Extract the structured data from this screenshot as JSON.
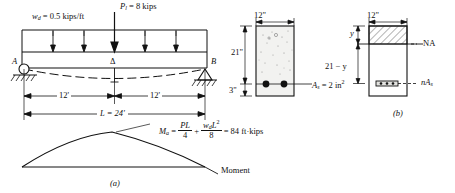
{
  "figure": {
    "title_a": "(a)",
    "title_b": "(b)"
  },
  "beam": {
    "distributed_load_label": "w",
    "distributed_load_sub": "d",
    "distributed_load_value": " = 0.5 kips/ft",
    "point_load_label": "P",
    "point_load_sub": "l",
    "point_load_value": " = 8 kips",
    "support_left": "A",
    "support_right": "B",
    "deflection_symbol": "Δ",
    "dim_left": "12'",
    "dim_right": "12'",
    "span_label": "L = 24'"
  },
  "moment_equation": {
    "symbol": "M",
    "symbol_sub": "a",
    "equals": " =",
    "term1_num": "PL",
    "term1_den": "4",
    "plus": "+",
    "term2_num": "w",
    "term2_num_sub": "d",
    "term2_num_tail": "L",
    "term2_num_sup": "2",
    "term2_den": "8",
    "result": " = 84 ft·kips"
  },
  "moment_diagram": {
    "axis_label": "Moment"
  },
  "cross_section_a": {
    "width_label": "12\"",
    "depth_label": "21\"",
    "cover_label": "3\"",
    "steel_label": "A",
    "steel_sub": "s",
    "steel_value": " = 2 in",
    "steel_sup": "2"
  },
  "cross_section_b": {
    "width_label": "12\"",
    "y_label": "y",
    "depth_minus_y_label": "21 − y",
    "neutral_axis_label": "NA",
    "transformed_steel_label": "n",
    "transformed_steel_sub": "A",
    "transformed_steel_sub2": "s"
  },
  "colors": {
    "ink": "#111111",
    "concrete_fill": "#f2f2f0",
    "hatch": "#555555"
  }
}
